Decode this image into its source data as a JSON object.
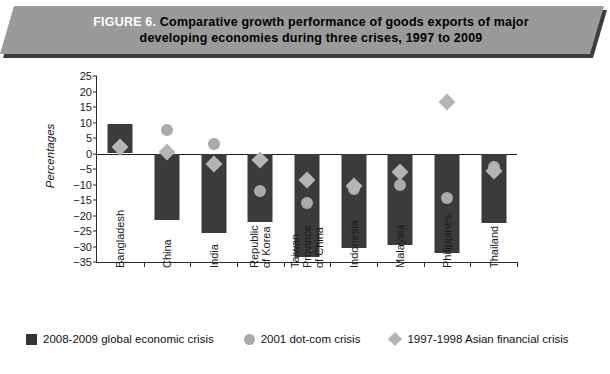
{
  "banner": {
    "figure_number": "FIGURE 6.",
    "title_line1": "Comparative growth performance of goods exports of major",
    "title_line2": "developing economies during three crises, 1997 to 2009",
    "fill_color": "#9a9a9a",
    "figure_number_color": "#ffffff"
  },
  "chart_data": {
    "type": "bar",
    "title": "Comparative growth performance of goods exports of major developing economies during three crises, 1997 to 2009",
    "xlabel": "",
    "ylabel": "Percentages",
    "ylim": [
      -35,
      25
    ],
    "ytick_step": 5,
    "yticks": [
      "25",
      "20",
      "15",
      "10",
      "5",
      "0",
      "−5",
      "−10",
      "−15",
      "−20",
      "−25",
      "−30",
      "−35"
    ],
    "grid": false,
    "legend_position": "bottom",
    "categories": [
      "Bangladesh",
      "China",
      "India",
      "Republic\nof Korea",
      "Taiwan\nProvince\nof China",
      "Indonesia",
      "Malaysia",
      "Philippines",
      "Thailand"
    ],
    "series": [
      {
        "name": "2008-2009 global economic crisis",
        "marker": "bar",
        "color": "#3b3b3b",
        "values": [
          9.5,
          -21.5,
          -25.5,
          -22.0,
          -33.5,
          -30.5,
          -29.5,
          -32.0,
          -22.5
        ]
      },
      {
        "name": "2001 dot-com crisis",
        "marker": "circle",
        "color": "#aaaaaa",
        "values": [
          null,
          7.5,
          3.0,
          -12.0,
          -16.0,
          -11.5,
          -10.0,
          -14.5,
          -4.5
        ]
      },
      {
        "name": "1997-1998 Asian financial crisis",
        "marker": "diamond",
        "color": "#b4b4b4",
        "values": [
          2.0,
          0.5,
          -3.5,
          -2.0,
          -8.5,
          -10.5,
          -6.0,
          16.5,
          -5.5
        ]
      }
    ]
  },
  "legend": {
    "items": [
      {
        "label": "2008-2009 global economic crisis",
        "shape": "square",
        "color": "#333333"
      },
      {
        "label": "2001 dot-com crisis",
        "shape": "circle",
        "color": "#a9a9a9"
      },
      {
        "label": "1997-1998 Asian financial crisis",
        "shape": "diamond",
        "color": "#b4b4b4"
      }
    ]
  }
}
